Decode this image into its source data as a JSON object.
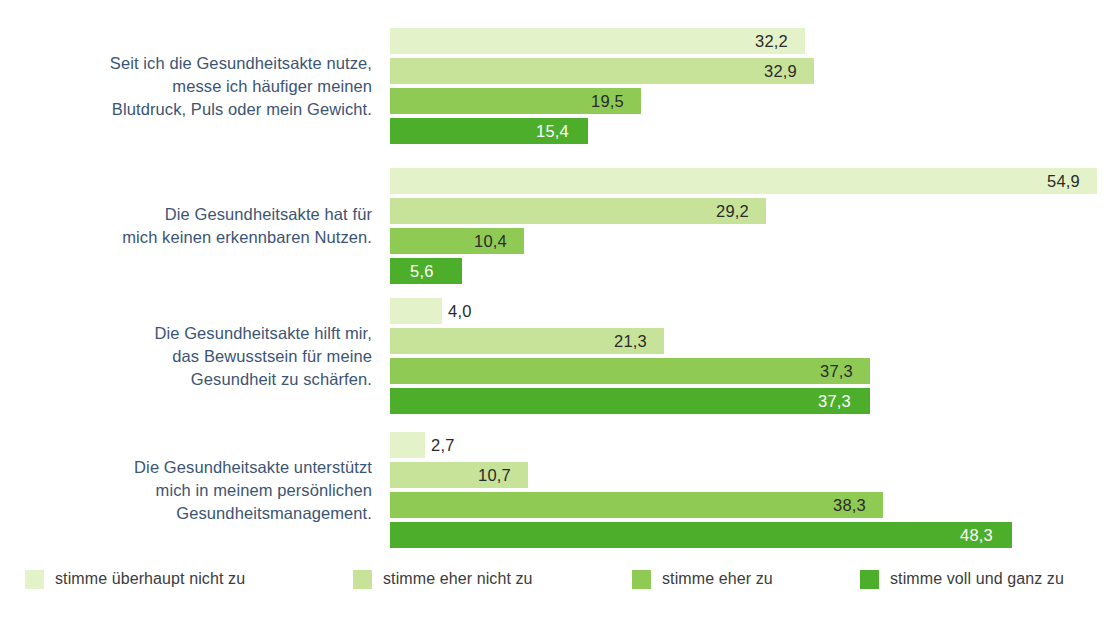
{
  "chart_data": {
    "type": "bar",
    "orientation": "horizontal",
    "title": "",
    "subtitle": "",
    "xlabel": "",
    "ylabel": "",
    "grid": false,
    "xlim": [
      0,
      56
    ],
    "legend_position": "bottom",
    "categories": [
      "Seit ich die Gesundheitsakte nutze, messe ich häufiger meinen Blutdruck, Puls oder mein Gewicht.",
      "Die Gesundheitsakte hat für mich keinen erkennbaren Nutzen.",
      "Die Gesundheitsakte hilft mir, das Bewusstsein für meine Gesundheit zu schärfen.",
      "Die Gesundheitsakte unterstützt mich in meinem persönlichen Gesundheitsmanagement."
    ],
    "series": [
      {
        "name": "stimme überhaupt nicht zu",
        "color": "#e4f2c9",
        "values": [
          32.2,
          54.9,
          4.0,
          2.7
        ]
      },
      {
        "name": "stimme eher nicht zu",
        "color": "#c7e39a",
        "values": [
          32.9,
          29.2,
          21.3,
          10.7
        ]
      },
      {
        "name": "stimme eher zu",
        "color": "#8fca54",
        "values": [
          19.5,
          10.4,
          37.3,
          38.3
        ]
      },
      {
        "name": "stimme voll und ganz zu",
        "color": "#4cae2a",
        "values": [
          15.4,
          5.6,
          37.3,
          48.3
        ]
      }
    ]
  },
  "groups": [
    {
      "label_lines": [
        "Seit ich die Gesundheitsakte nutze,",
        "messe ich häufiger meinen",
        "Blutdruck, Puls oder mein Gewicht."
      ],
      "bars": [
        {
          "value": "32,2",
          "num": 32.2,
          "series": 0,
          "label_inside": false
        },
        {
          "value": "32,9",
          "num": 32.9,
          "series": 1,
          "label_inside": false
        },
        {
          "value": "19,5",
          "num": 19.5,
          "series": 2,
          "label_inside": false
        },
        {
          "value": "15,4",
          "num": 15.4,
          "series": 3,
          "label_inside": true
        }
      ]
    },
    {
      "label_lines": [
        "Die Gesundheitsakte hat für",
        "mich keinen erkennbaren Nutzen."
      ],
      "bars": [
        {
          "value": "54,9",
          "num": 54.9,
          "series": 0,
          "label_inside": false
        },
        {
          "value": "29,2",
          "num": 29.2,
          "series": 1,
          "label_inside": false
        },
        {
          "value": "10,4",
          "num": 10.4,
          "series": 2,
          "label_inside": false
        },
        {
          "value": "5,6",
          "num": 5.6,
          "series": 3,
          "label_inside": true
        }
      ]
    },
    {
      "label_lines": [
        "Die Gesundheitsakte hilft mir,",
        "das Bewusstsein für meine",
        "Gesundheit zu schärfen."
      ],
      "bars": [
        {
          "value": "4,0",
          "num": 4.0,
          "series": 0,
          "label_inside": false
        },
        {
          "value": "21,3",
          "num": 21.3,
          "series": 1,
          "label_inside": false
        },
        {
          "value": "37,3",
          "num": 37.3,
          "series": 2,
          "label_inside": false
        },
        {
          "value": "37,3",
          "num": 37.3,
          "series": 3,
          "label_inside": true
        }
      ]
    },
    {
      "label_lines": [
        "Die Gesundheitsakte unterstützt",
        "mich in meinem persönlichen",
        "Gesundheitsmanagement."
      ],
      "bars": [
        {
          "value": "2,7",
          "num": 2.7,
          "series": 0,
          "label_inside": false
        },
        {
          "value": "10,7",
          "num": 10.7,
          "series": 1,
          "label_inside": false
        },
        {
          "value": "38,3",
          "num": 38.3,
          "series": 2,
          "label_inside": false
        },
        {
          "value": "48,3",
          "num": 48.3,
          "series": 3,
          "label_inside": true
        }
      ]
    }
  ],
  "legend": {
    "items": [
      {
        "label": "stimme überhaupt nicht zu",
        "color": "#e4f2c9",
        "x": 25
      },
      {
        "label": "stimme eher nicht zu",
        "color": "#c7e39a",
        "x": 353
      },
      {
        "label": "stimme eher zu",
        "color": "#8fca54",
        "x": 632
      },
      {
        "label": "stimme voll und ganz zu",
        "color": "#4cae2a",
        "x": 860
      }
    ]
  },
  "layout": {
    "bar_origin_x": 390,
    "px_per_unit": 12.88,
    "group_tops": [
      28,
      168,
      298,
      432
    ],
    "bar_height": 26,
    "bar_gap": 4
  }
}
